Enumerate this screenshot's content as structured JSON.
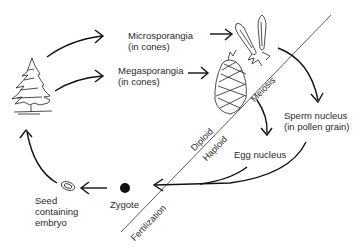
{
  "diagram": {
    "type": "life-cycle",
    "nodes": [
      {
        "id": "tree",
        "label": ""
      },
      {
        "id": "microsporangia",
        "label": "Microsporangia\n(in cones)"
      },
      {
        "id": "megasporangia",
        "label": "Megasporangia\n(in cones)"
      },
      {
        "id": "sperm",
        "label": "Sperm nucleus\n(in pollen grain)"
      },
      {
        "id": "egg",
        "label": "Egg nucleus"
      },
      {
        "id": "zygote",
        "label": "Zygote"
      },
      {
        "id": "seed",
        "label": "Seed\ncontaining\nembryo"
      }
    ],
    "divider_labels": {
      "meiosis": "Meiosis",
      "diploid": "Diploid",
      "haploid": "Haploid",
      "fertilization": "Fertilization"
    },
    "edges": [
      [
        "tree",
        "microsporangia"
      ],
      [
        "tree",
        "megasporangia"
      ],
      [
        "microsporangia",
        "sperm"
      ],
      [
        "megasporangia",
        "egg"
      ],
      [
        "sperm",
        "zygote"
      ],
      [
        "egg",
        "zygote"
      ],
      [
        "zygote",
        "seed"
      ],
      [
        "seed",
        "tree"
      ]
    ]
  }
}
